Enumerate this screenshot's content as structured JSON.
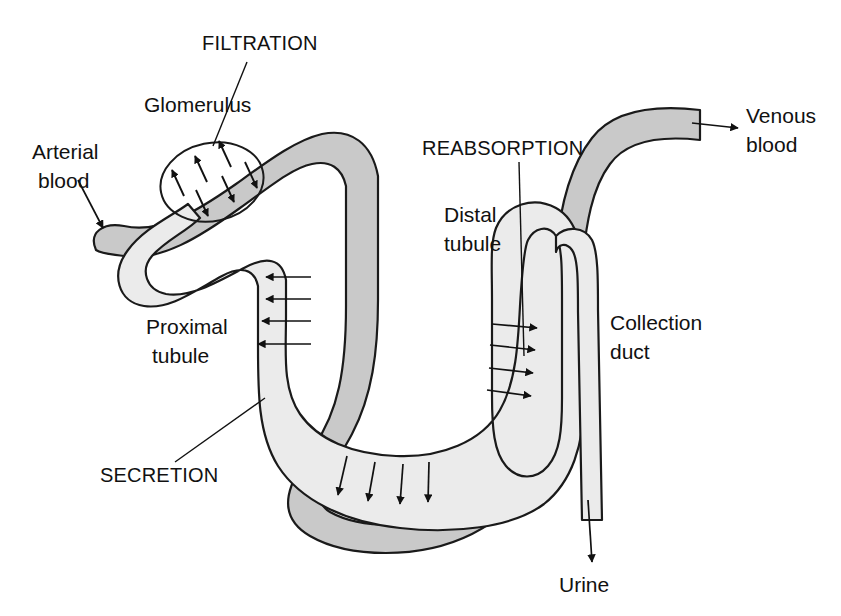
{
  "figure": {
    "background_color": "#ffffff",
    "blood_vessel_fill": "#c9c9c9",
    "tubule_fill": "#ebebeb",
    "outline_color": "#1a1a1a",
    "text_color": "#111111"
  },
  "labels": {
    "filtration": "FILTRATION",
    "glomerulus": "Glomerulus",
    "arterial_blood_line1": "Arterial",
    "arterial_blood_line2": "blood",
    "reabsorption": "REABSORPTION",
    "distal_tubule_line1": "Distal",
    "distal_tubule_line2": "tubule",
    "venous_blood_line1": "Venous",
    "venous_blood_line2": "blood",
    "proximal_tubule_line1": "Proximal",
    "proximal_tubule_line2": "tubule",
    "collection_duct_line1": "Collection",
    "collection_duct_line2": "duct",
    "secretion": "SECRETION",
    "urine": "Urine"
  },
  "processes": [
    {
      "name": "FILTRATION",
      "location": "Glomerulus",
      "direction": "blood to tubule",
      "arrow_count": 6
    },
    {
      "name": "SECRETION",
      "location": "Proximal tubule",
      "direction": "blood to tubule",
      "arrow_count": 4
    },
    {
      "name": "REABSORPTION",
      "location": "Distal tubule",
      "direction": "tubule to blood",
      "arrow_count": 4
    },
    {
      "name": "SECRETION",
      "location": "Loop of Henle bottom",
      "direction": "tubule to blood",
      "arrow_count": 4
    }
  ],
  "flow_endpoints": [
    {
      "name": "Arterial blood",
      "type": "inlet"
    },
    {
      "name": "Venous blood",
      "type": "outlet"
    },
    {
      "name": "Urine",
      "type": "outlet"
    }
  ]
}
